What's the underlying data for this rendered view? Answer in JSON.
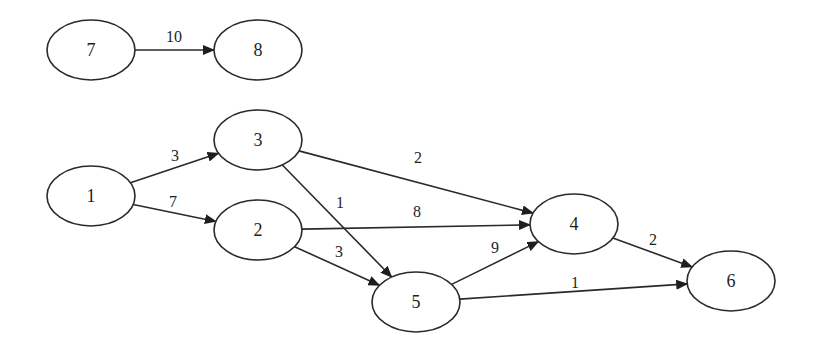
{
  "diagram": {
    "type": "directed-weighted-graph",
    "nodes": [
      {
        "id": "7",
        "label": "7",
        "x": 91,
        "y": 50
      },
      {
        "id": "8",
        "label": "8",
        "x": 258,
        "y": 50
      },
      {
        "id": "3",
        "label": "3",
        "x": 258,
        "y": 140
      },
      {
        "id": "1",
        "label": "1",
        "x": 91,
        "y": 196
      },
      {
        "id": "2",
        "label": "2",
        "x": 258,
        "y": 230
      },
      {
        "id": "4",
        "label": "4",
        "x": 574,
        "y": 224
      },
      {
        "id": "5",
        "label": "5",
        "x": 416,
        "y": 302
      },
      {
        "id": "6",
        "label": "6",
        "x": 731,
        "y": 281
      }
    ],
    "edges": [
      {
        "from": "7",
        "to": "8",
        "weight": "10",
        "lx": 174,
        "ly": 36
      },
      {
        "from": "1",
        "to": "3",
        "weight": "3",
        "lx": 175,
        "ly": 155
      },
      {
        "from": "1",
        "to": "2",
        "weight": "7",
        "lx": 173,
        "ly": 201
      },
      {
        "from": "3",
        "to": "4",
        "weight": "2",
        "lx": 418,
        "ly": 157
      },
      {
        "from": "3",
        "to": "5",
        "weight": "1",
        "lx": 340,
        "ly": 202
      },
      {
        "from": "2",
        "to": "4",
        "weight": "8",
        "lx": 417,
        "ly": 211
      },
      {
        "from": "2",
        "to": "5",
        "weight": "3",
        "lx": 339,
        "ly": 251
      },
      {
        "from": "5",
        "to": "4",
        "weight": "9",
        "lx": 495,
        "ly": 247
      },
      {
        "from": "4",
        "to": "6",
        "weight": "2",
        "lx": 653,
        "ly": 239
      },
      {
        "from": "5",
        "to": "6",
        "weight": "1",
        "lx": 575,
        "ly": 282
      }
    ],
    "node_rx": 44,
    "node_ry": 30,
    "stroke_color": "#2a2a2a",
    "background": "#ffffff"
  }
}
